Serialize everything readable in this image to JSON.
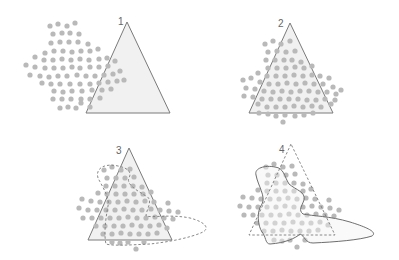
{
  "panels": [
    {
      "id": 1,
      "label": "1",
      "description": "Point cloud largely outside the triangle"
    },
    {
      "id": 2,
      "label": "2",
      "description": "Point cloud centered on the triangle"
    },
    {
      "id": 3,
      "label": "3",
      "description": "Triangle with dashed irregular hull outline"
    },
    {
      "id": 4,
      "label": "4",
      "description": "Dashed triangle with solid irregular hull outline"
    }
  ],
  "colors": {
    "triangle_stroke": "#7a7a7a",
    "triangle_fill": "#f1f1f1",
    "dot": "#b9b9b9",
    "outline": "#7a7a7a",
    "label": "#666666"
  }
}
